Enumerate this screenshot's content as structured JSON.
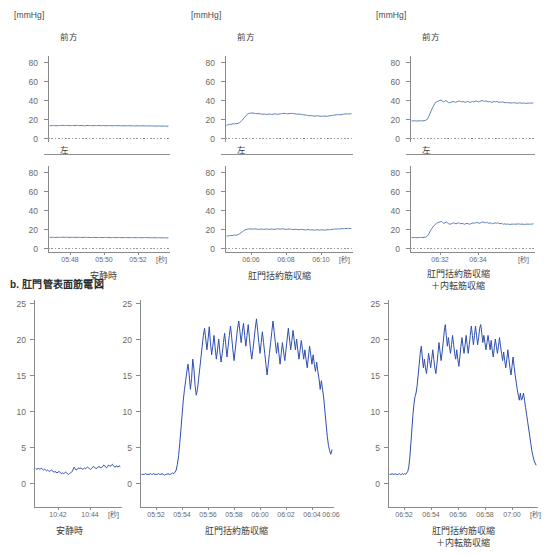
{
  "figure": {
    "sections": [
      {
        "id": "a",
        "label": ""
      },
      {
        "id": "b",
        "label": "b. 肛門管表面筋電図"
      }
    ]
  },
  "manometry": {
    "y_unit": "[mmHg]",
    "x_unit": "[秒]",
    "y_ticks": [
      "80",
      "60",
      "40",
      "20",
      "0"
    ],
    "y_min": 0,
    "y_max": 90,
    "sub_labels": {
      "anterior": "前方",
      "left": "左"
    },
    "panels": [
      {
        "caption": "安静時",
        "x_ticks": [
          "05:48",
          "05:50",
          "05:52"
        ],
        "anterior": {
          "label": "前方",
          "baseline": 13,
          "values": [
            13,
            13,
            13,
            13.2,
            13,
            12.8,
            13,
            13.1,
            13,
            13.2,
            13.4,
            13.2,
            13,
            13.1,
            13.3,
            13.2,
            13,
            13.1,
            13,
            13.2,
            13.1,
            13,
            13.2,
            13.3,
            13.1,
            13,
            13.1,
            13.2,
            13,
            12.9,
            13,
            13.1,
            13.2,
            13,
            13.1,
            13,
            12.9,
            13,
            13.1,
            13,
            13.1,
            13.2,
            13,
            12.9,
            13,
            13.1,
            13,
            12.9,
            13,
            13,
            13.1,
            13,
            12.9,
            12.8,
            13,
            13.1,
            13,
            12.9,
            13,
            13,
            12.9,
            12.8,
            13,
            12.9,
            12.8,
            12.9,
            13,
            12.9,
            12.8,
            12.9,
            12.8,
            12.7,
            12.8,
            12.9,
            12.8,
            12.7,
            12.8,
            12.9,
            12.8,
            12.7,
            12.8,
            12.7,
            12.6,
            12.7,
            12.8,
            12.7,
            12.6,
            12.7,
            12.6,
            12.5,
            12.6,
            12.7,
            12.6,
            12.5,
            12.6,
            12.5,
            12.6,
            12.5,
            12.4,
            12.5
          ]
        },
        "left": {
          "label": "左",
          "baseline": 11,
          "values": [
            11.2,
            11.2,
            11.3,
            11.2,
            11.1,
            11.2,
            11.3,
            11.2,
            11.1,
            11.2,
            11.3,
            11.4,
            11.3,
            11.2,
            11.3,
            11.2,
            11.1,
            11.2,
            11.3,
            11.2,
            11.3,
            11.2,
            11.1,
            11.2,
            11.3,
            11.2,
            11.1,
            11.2,
            11.1,
            11.2,
            11.3,
            11.2,
            11.1,
            11.2,
            11.1,
            11,
            11.1,
            11.2,
            11.1,
            11,
            11.1,
            11.2,
            11.1,
            11,
            11.1,
            11,
            11.1,
            11.2,
            11.1,
            11,
            11.1,
            11,
            10.9,
            11,
            11.1,
            11,
            10.9,
            11,
            11.1,
            11,
            10.9,
            11,
            10.9,
            11,
            11.1,
            11,
            10.9,
            11,
            10.9,
            10.8,
            10.9,
            11,
            10.9,
            10.8,
            10.9,
            11,
            10.9,
            10.8,
            10.9,
            10.8,
            10.9,
            11,
            10.9,
            10.8,
            10.9,
            10.8,
            10.7,
            10.8,
            10.9,
            10.8,
            10.7,
            10.8,
            10.9,
            10.8,
            10.7,
            10.8,
            10.7,
            10.8,
            10.7,
            10.6,
            10.7
          ]
        }
      },
      {
        "caption": "肛門括約筋収縮",
        "x_ticks": [
          "06:06",
          "06:08",
          "06:10"
        ],
        "anterior": {
          "label": "前方",
          "baseline": 14,
          "values": [
            13.5,
            14,
            14.5,
            14,
            14.6,
            15,
            14.8,
            15.2,
            15,
            15.6,
            16,
            17,
            18.5,
            20,
            21.5,
            23,
            24.5,
            25.5,
            26,
            26.2,
            26.4,
            26.2,
            26,
            25.8,
            25.6,
            25.8,
            25.6,
            25.4,
            25.2,
            25,
            25.2,
            25,
            24.8,
            25,
            25.2,
            25,
            24.8,
            25,
            25.2,
            25.4,
            25.2,
            25,
            25.2,
            25.4,
            25.6,
            25.8,
            26,
            25.8,
            25.6,
            25.4,
            25.6,
            25.8,
            26,
            25.8,
            25.6,
            25.4,
            25.2,
            25,
            25.2,
            25,
            24.8,
            24.6,
            24.4,
            24.2,
            24,
            23.8,
            23.6,
            23.4,
            23.6,
            23.4,
            23.2,
            23,
            23.2,
            23.4,
            23.2,
            23,
            22.8,
            23,
            23.2,
            23,
            22.8,
            23,
            23.2,
            23.4,
            23.6,
            23.8,
            24,
            24.2,
            24.4,
            24.6,
            24.5,
            24.4,
            24.6,
            24.8,
            25,
            25.2,
            25.4,
            25.3,
            25.2,
            25.4,
            25.6
          ]
        },
        "left": {
          "label": "左",
          "baseline": 13,
          "values": [
            12.5,
            12.8,
            13,
            13.2,
            13,
            13.4,
            13.6,
            13.4,
            13.8,
            14.2,
            15,
            16,
            17,
            18,
            18.8,
            19.4,
            19.8,
            20,
            20.2,
            20,
            19.8,
            20,
            20.2,
            20,
            19.8,
            19.6,
            19.8,
            20,
            19.8,
            19.6,
            19.8,
            20,
            19.8,
            19.6,
            19.8,
            20,
            19.8,
            19.6,
            19.8,
            20,
            20.2,
            20,
            19.8,
            20,
            20.2,
            20,
            19.8,
            19.6,
            19.8,
            20,
            19.8,
            19.6,
            19.4,
            19.6,
            19.8,
            19.6,
            19.4,
            19.2,
            19.4,
            19.6,
            19.4,
            19.2,
            19,
            19.2,
            19.4,
            19.2,
            19,
            19.2,
            19,
            18.8,
            19,
            19.2,
            19,
            18.8,
            19,
            19.2,
            19,
            18.8,
            19,
            19.2,
            19.4,
            19.2,
            19.4,
            19.6,
            19.8,
            20,
            19.8,
            20,
            20.2,
            20,
            20.2,
            20.4,
            20.2,
            20.4,
            20.6,
            20.4,
            20.6,
            20.4,
            20.6
          ]
        }
      },
      {
        "caption": "肛門括約筋収縮\n＋内転筋収縮",
        "x_ticks": [
          "06:32",
          "06:34"
        ],
        "anterior": {
          "label": "前方",
          "baseline": 18,
          "values": [
            18,
            18,
            18.2,
            18,
            17.8,
            18,
            18.2,
            18,
            18.2,
            18,
            18.2,
            18.5,
            19,
            20.5,
            23,
            26,
            29,
            32,
            34.5,
            36.5,
            38,
            38.5,
            39,
            39.5,
            40,
            39,
            38,
            38.5,
            39.5,
            38.5,
            37.5,
            37,
            37.5,
            38,
            38.5,
            38,
            37.5,
            38,
            38.5,
            39,
            38.5,
            38,
            38.5,
            38,
            37.5,
            38,
            38.5,
            38,
            37.5,
            38,
            38.5,
            38,
            38.5,
            39,
            38.5,
            38,
            38.5,
            39,
            39.5,
            39,
            38.5,
            39,
            38.5,
            38,
            38.5,
            38,
            37.5,
            38,
            38.5,
            38,
            38.5,
            38,
            37.5,
            38,
            37.5,
            38,
            37.5,
            37,
            37.5,
            37,
            37.2,
            37,
            36.8,
            37,
            37.2,
            37,
            36.8,
            36.6,
            36.8,
            37,
            36.8,
            36.6,
            36.8,
            36.6,
            36.4,
            36.6,
            36.8,
            36.6,
            36.8,
            36.6,
            37
          ]
        },
        "left": {
          "label": "左",
          "baseline": 11,
          "values": [
            11,
            11,
            11.2,
            11,
            10.8,
            11,
            11.2,
            11,
            11.2,
            11,
            11.2,
            11.5,
            12,
            13.5,
            15.5,
            18,
            20,
            22,
            23.5,
            25,
            26,
            26.5,
            27,
            27.5,
            28,
            27,
            26,
            26.5,
            27.5,
            26.5,
            25.5,
            25,
            25.5,
            26,
            26.5,
            26,
            25.5,
            26,
            26.5,
            26,
            25.5,
            26,
            25.5,
            25,
            25.5,
            26,
            25.5,
            25,
            25.5,
            26,
            26.5,
            26,
            26.5,
            27,
            26.5,
            26,
            26.5,
            27,
            27.5,
            27,
            26.5,
            27,
            26.5,
            26,
            26.5,
            26,
            25.5,
            26,
            26.5,
            26,
            26.5,
            26,
            25.5,
            26,
            25.5,
            25,
            25.5,
            25,
            25.2,
            25,
            24.8,
            25,
            25.2,
            25,
            25.2,
            25,
            25.2,
            25.4,
            25.2,
            25,
            25.2,
            25,
            24.8,
            25,
            25.2,
            25,
            25.2,
            25,
            25.2,
            25.4
          ]
        }
      }
    ]
  },
  "emg": {
    "x_unit": "[秒]",
    "y_ticks": [
      "25",
      "20",
      "15",
      "10",
      "5",
      "0"
    ],
    "y_min": 0,
    "y_max": 25,
    "panels": [
      {
        "caption": "安静時",
        "x_ticks": [
          "10:42",
          "10:44"
        ],
        "values": [
          2.0,
          1.9,
          2.0,
          2.0,
          1.9,
          2.0,
          2.0,
          1.9,
          1.8,
          1.9,
          1.8,
          1.7,
          1.8,
          1.7,
          1.6,
          1.7,
          1.8,
          1.7,
          1.6,
          1.5,
          1.6,
          1.5,
          1.4,
          1.5,
          1.6,
          1.5,
          1.4,
          1.3,
          1.4,
          1.3,
          1.4,
          1.5,
          1.4,
          1.3,
          1.2,
          1.3,
          1.4,
          1.5,
          1.6,
          1.9,
          2.2,
          2.0,
          1.8,
          1.9,
          2.0,
          2.1,
          2.0,
          2.1,
          2.0,
          1.9,
          2.0,
          2.1,
          2.0,
          2.1,
          2.2,
          2.1,
          2.0,
          1.9,
          2.0,
          2.1,
          2.3,
          2.2,
          2.1,
          2.0,
          2.1,
          2.2,
          2.3,
          2.2,
          2.1,
          2.2,
          2.3,
          2.5,
          2.4,
          2.2,
          2.1,
          2.3,
          2.5,
          2.4,
          2.3,
          2.5,
          2.6,
          2.4,
          2.3,
          2.2,
          2.4,
          2.3,
          2.2,
          2.4,
          2.3
        ]
      },
      {
        "caption": "肛門括約筋収縮",
        "x_ticks": [
          "05:52",
          "05:54",
          "05:56",
          "05:58",
          "06:00",
          "06:02",
          "06:04",
          "06:06"
        ],
        "values": [
          1.2,
          1.2,
          1.2,
          1.3,
          1.2,
          1.2,
          1.2,
          1.3,
          1.2,
          1.2,
          1.3,
          1.2,
          1.2,
          1.2,
          1.3,
          1.2,
          1.2,
          1.3,
          1.2,
          1.1,
          1.2,
          1.2,
          1.3,
          1.2,
          1.2,
          1.3,
          1.4,
          1.3,
          1.5,
          1.8,
          2.6,
          3.8,
          5.5,
          7.5,
          9.5,
          11.5,
          13.0,
          14.2,
          15.5,
          16.5,
          15.0,
          13.0,
          14.5,
          17.2,
          15.8,
          13.5,
          12.2,
          13.0,
          14.5,
          16.0,
          17.5,
          19.0,
          20.5,
          21.5,
          20.0,
          18.5,
          20.0,
          21.7,
          19.5,
          17.8,
          19.0,
          20.5,
          18.8,
          17.2,
          18.5,
          20.0,
          18.2,
          16.8,
          18.0,
          19.5,
          20.8,
          19.2,
          17.5,
          19.0,
          20.5,
          21.8,
          20.2,
          18.5,
          17.0,
          18.5,
          20.0,
          21.5,
          22.5,
          21.0,
          19.5,
          21.0,
          22.2,
          20.5,
          19.0,
          20.5,
          22.0,
          20.2,
          18.5,
          17.2,
          18.5,
          20.0,
          21.5,
          22.8,
          21.2,
          19.5,
          18.0,
          19.5,
          21.0,
          19.5,
          18.0,
          16.5,
          15.0,
          16.5,
          18.0,
          19.5,
          21.0,
          22.5,
          21.0,
          19.5,
          18.0,
          19.5,
          18.0,
          16.5,
          18.0,
          19.5,
          18.2,
          17.0,
          18.5,
          20.0,
          21.5,
          20.0,
          18.5,
          19.8,
          21.2,
          19.8,
          18.5,
          20.0,
          18.5,
          17.2,
          18.5,
          19.8,
          18.5,
          17.2,
          18.5,
          17.2,
          16.0,
          17.5,
          19.0,
          17.8,
          16.5,
          17.8,
          16.5,
          15.5,
          16.8,
          15.5,
          14.5,
          13.0,
          14.2,
          13.0,
          11.8,
          10.0,
          8.2,
          6.5,
          5.2,
          4.5,
          4.0,
          4.6
        ]
      },
      {
        "caption": "肛門括約筋収縮\n＋内転筋収縮",
        "x_ticks": [
          "06:52",
          "06:54",
          "06:56",
          "06:58",
          "07:00"
        ],
        "values": [
          1.2,
          1.2,
          1.3,
          1.2,
          1.2,
          1.3,
          1.2,
          1.2,
          1.2,
          1.3,
          1.2,
          1.2,
          1.3,
          1.2,
          1.3,
          1.2,
          1.4,
          1.6,
          2.2,
          3.5,
          5.5,
          7.5,
          9.5,
          11.0,
          12.0,
          12.5,
          13.5,
          15.0,
          16.5,
          18.0,
          19.0,
          17.5,
          16.0,
          17.2,
          16.0,
          15.2,
          16.5,
          18.0,
          17.0,
          16.0,
          17.2,
          18.5,
          17.2,
          16.0,
          15.2,
          16.5,
          18.0,
          19.5,
          18.2,
          17.0,
          18.2,
          19.5,
          21.0,
          22.0,
          20.5,
          19.0,
          20.2,
          19.0,
          18.0,
          19.2,
          20.5,
          19.2,
          18.0,
          17.2,
          18.5,
          17.2,
          16.2,
          17.5,
          19.0,
          20.2,
          19.0,
          18.0,
          19.2,
          20.5,
          19.2,
          18.0,
          19.2,
          20.5,
          21.8,
          20.5,
          19.2,
          20.5,
          21.8,
          20.5,
          19.2,
          20.2,
          21.5,
          22.0,
          20.8,
          19.5,
          20.5,
          19.5,
          18.5,
          19.5,
          20.5,
          19.5,
          18.5,
          19.8,
          18.5,
          17.5,
          18.8,
          20.0,
          19.0,
          18.0,
          19.0,
          20.2,
          19.0,
          18.0,
          17.0,
          18.2,
          17.0,
          16.0,
          17.2,
          18.5,
          17.2,
          16.0,
          15.0,
          16.2,
          17.5,
          16.2,
          15.0,
          14.0,
          13.0,
          12.2,
          11.5,
          12.5,
          11.5,
          11.8,
          12.5,
          11.5,
          10.5,
          9.5,
          8.5,
          7.5,
          6.5,
          5.5,
          4.5,
          3.8,
          3.2,
          2.8,
          2.5
        ]
      }
    ]
  },
  "colors": {
    "pressure_trace": "#5b7fb5",
    "emg_trace": "#2f4fae",
    "axis": "#8a8a8a",
    "text": "#3a3a3a"
  }
}
